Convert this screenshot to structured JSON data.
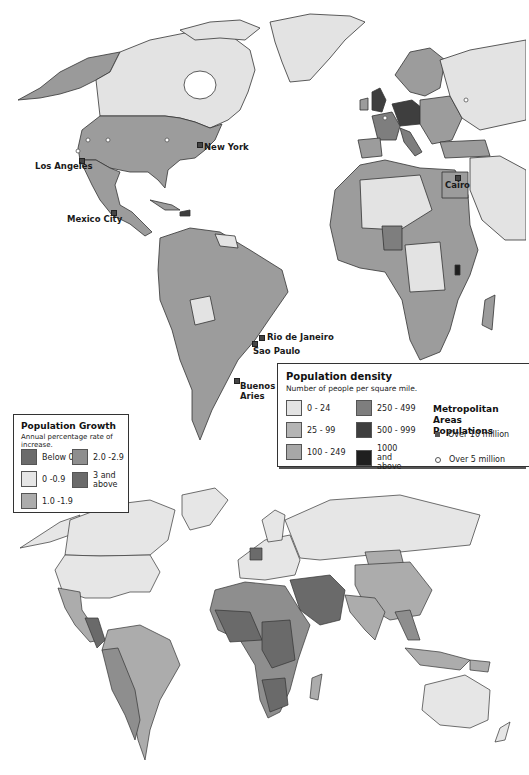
{
  "colors": {
    "density_0_24": "#e3e3e3",
    "density_25_99": "#b4b4b4",
    "density_100_249": "#a7a7a7",
    "density_250_499": "#7e7e7e",
    "density_500_999": "#3e3e3e",
    "density_1000_above": "#1f1f1f",
    "growth_below_0": "#6b6b6b",
    "growth_0_0_9": "#e6e6e6",
    "growth_1_0_1_9": "#acacac",
    "growth_2_0_2_9": "#8e8e8e",
    "growth_3_above": "#6a6a6a",
    "border": "#333333",
    "ocean": "#ffffff"
  },
  "top_map": {
    "cities": [
      {
        "name": "New York",
        "type": "over_10_million"
      },
      {
        "name": "Los Angeles",
        "type": "over_10_million"
      },
      {
        "name": "Mexico City",
        "type": "over_10_million"
      },
      {
        "name": "Cairo",
        "type": "over_10_million"
      },
      {
        "name": "Rio de Janeiro",
        "type": "over_10_million"
      },
      {
        "name": "Sao Paulo",
        "type": "over_10_million"
      },
      {
        "name": "Buenos Aries",
        "type": "over_10_million"
      }
    ]
  },
  "density_legend": {
    "title": "Population density",
    "subtitle": "Number of people per square mile.",
    "items": [
      {
        "label": "0 - 24"
      },
      {
        "label": "25 - 99"
      },
      {
        "label": "100 - 249"
      },
      {
        "label": "250 - 499"
      },
      {
        "label": "500 - 999"
      },
      {
        "label": "1000 and above"
      }
    ],
    "metro": {
      "title_line1": "Metropolitan Areas",
      "title_line2": "Populations",
      "items": [
        {
          "label": "Over 10 million",
          "symbol": "square"
        },
        {
          "label": "Over 5 million",
          "symbol": "circle"
        }
      ]
    }
  },
  "growth_legend": {
    "title": "Population Growth",
    "subtitle": "Annual percentage rate of increase.",
    "items": [
      {
        "label": "Below 0"
      },
      {
        "label": "0 -0.9"
      },
      {
        "label": "1.0 -1.9"
      },
      {
        "label": "2.0 -2.9"
      },
      {
        "label": "3 and above"
      }
    ]
  }
}
